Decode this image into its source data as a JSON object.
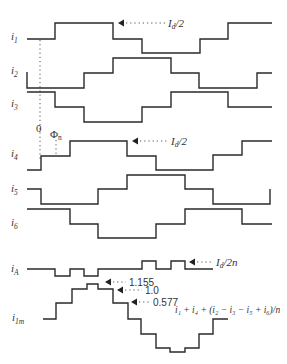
{
  "diagram": {
    "type": "current-waveforms",
    "waveforms": [
      {
        "id": "i1",
        "label": "i",
        "sub": "1",
        "label_y": 40,
        "points": "27,39 55,39 55,23 113,23 113,39 142,39 142,53 200,53 200,39 228,39 228,23 272,23"
      },
      {
        "id": "i2",
        "label": "i",
        "sub": "2",
        "label_y": 74,
        "points": "27,72 27,88 84,88 84,73 113,73 113,58 171,58 171,73 199,73 199,88 257,88 257,73 272,73"
      },
      {
        "id": "i3",
        "label": "i",
        "sub": "3",
        "label_y": 107,
        "points": "27,92 55,92 55,107 84,107 84,122 142,122 142,107 171,107 171,92 228,92 228,107 272,107"
      },
      {
        "id": "i4",
        "label": "i",
        "sub": "4",
        "label_y": 157,
        "points": "27,170 41,170 41,156 70,156 70,141 127,141 127,156 156,156 156,170 213,170 213,155 242,155 242,141 272,141"
      },
      {
        "id": "i5",
        "label": "i",
        "sub": "5",
        "label_y": 192,
        "points": "27,189 41,189 41,204 98,204 98,189 127,189 127,175 185,175 185,189 213,189 213,204 270,204 270,189"
      },
      {
        "id": "i6",
        "label": "i",
        "sub": "6",
        "label_y": 226,
        "points": "27,209 70,209 70,224 98,224 98,238 156,238 156,224 185,224 185,209 242,209 242,224 272,224"
      },
      {
        "id": "iA",
        "label": "i",
        "sub": "A",
        "label_y": 272,
        "points": "27,269 55,269 55,276 70,276 70,269 84,269 84,276 98,276 98,269 142,269 142,261 156,261 156,269 171,269 171,261 185,261 185,269 213,269"
      },
      {
        "id": "i1m",
        "label": "i",
        "sub": "1m",
        "label_y": 321,
        "points": "43,319 56,319 56,303 72,303 72,289 87,289 87,284 98,284 98,289 113,289 113,303 128,303 128,319 141,319 141,334 156,334 156,348 170,348 170,352 185,352 185,348 199,348 199,334 213,334 213,319 228,319"
      }
    ],
    "axis_markers": {
      "zero_label": "0",
      "phase_label": "Φ",
      "phase_sub": "n"
    },
    "annotations": [
      {
        "id": "id2-top",
        "text_main": "I",
        "text_sub": "d",
        "text_tail": "/2",
        "arrow_x": 118,
        "arrow_y": 23,
        "line_end": 165,
        "text_x": 168,
        "text_y": 27
      },
      {
        "id": "id2-mid",
        "text_main": "I",
        "text_sub": "d",
        "text_tail": "/2",
        "arrow_x": 132,
        "arrow_y": 141,
        "line_end": 168,
        "text_x": 171,
        "text_y": 145
      },
      {
        "id": "id2n",
        "text_main": "I",
        "text_sub": "d",
        "text_tail": "/2n",
        "arrow_x": 189,
        "arrow_y": 262,
        "line_end": 212,
        "text_x": 216,
        "text_y": 266
      },
      {
        "id": "v1155",
        "text": "1.155",
        "arrow_x": 105,
        "arrow_y": 282,
        "line_end": 126,
        "text_x": 129,
        "text_y": 286
      },
      {
        "id": "v10",
        "text": "1.0",
        "arrow_x": 117,
        "arrow_y": 290,
        "line_end": 142,
        "text_x": 145,
        "text_y": 294
      },
      {
        "id": "v0577",
        "text": "0.577",
        "arrow_x": 131,
        "arrow_y": 302,
        "line_end": 150,
        "text_x": 153,
        "text_y": 306
      }
    ],
    "formula": "i₁ + i₄ + (i₂ − i₃ − i₅ + i₆)/n"
  }
}
